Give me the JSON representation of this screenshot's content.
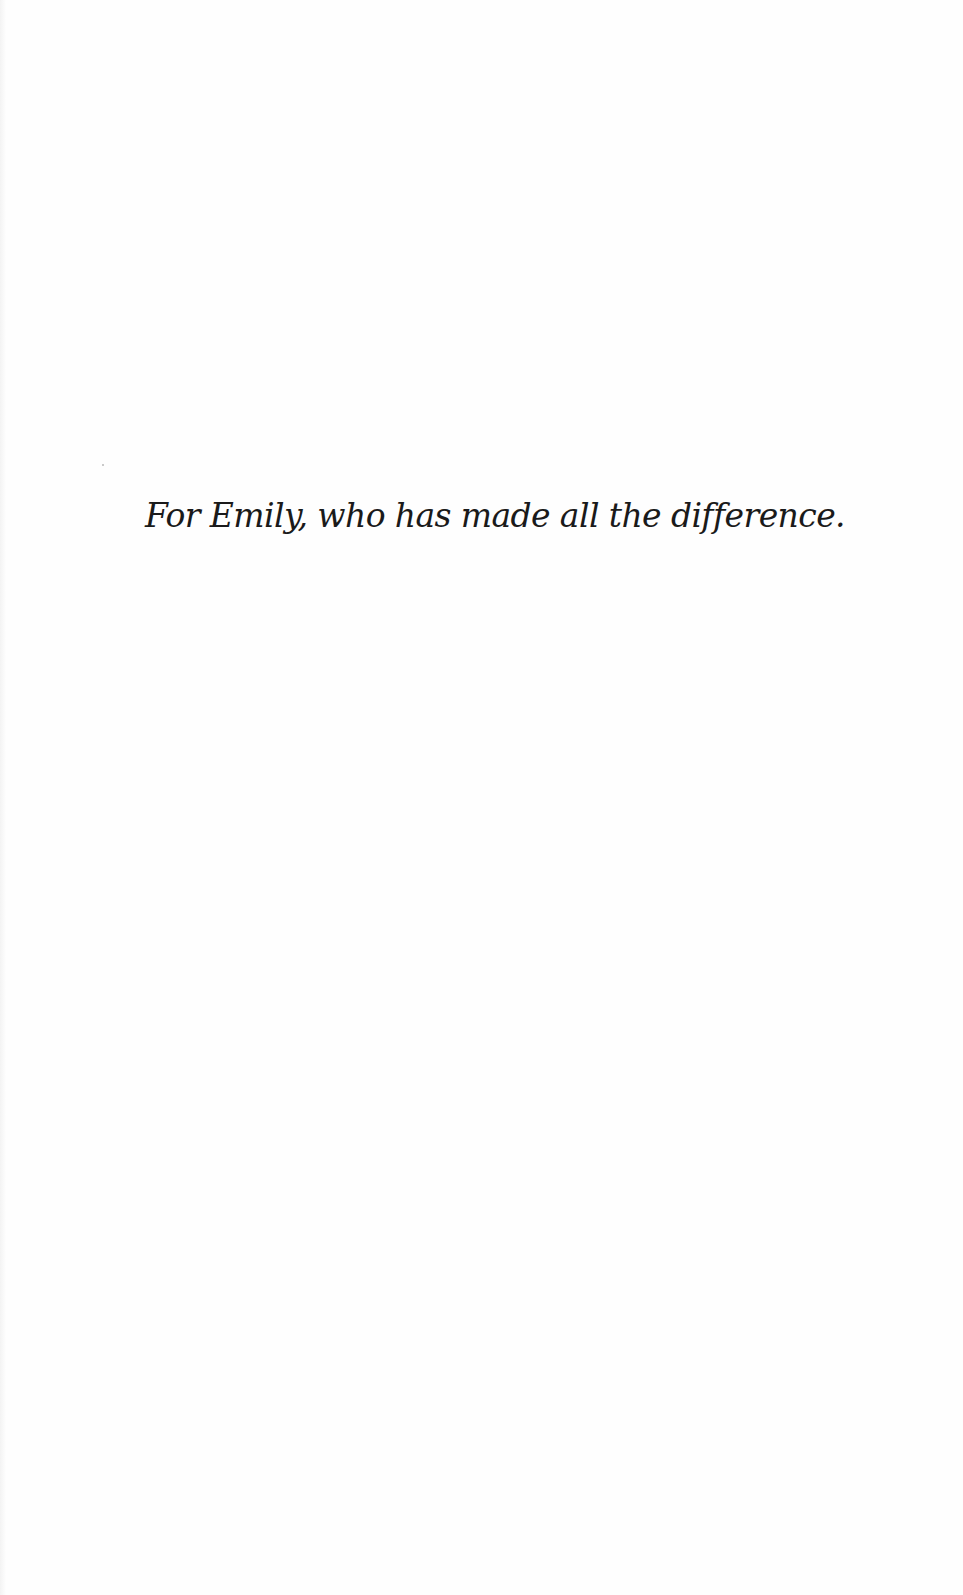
{
  "page": {
    "type": "dedication",
    "text": "For Emily, who has made all the difference."
  }
}
